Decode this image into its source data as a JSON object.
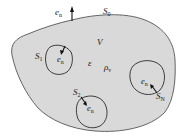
{
  "diagram": {
    "title": "",
    "colors": {
      "region_fill": "#d9d9d9",
      "outline": "#555555",
      "inner_outline": "#2a2a2a",
      "text": "#222222"
    },
    "outer_surface": {
      "label": "S",
      "label_sub": "0",
      "normal": {
        "label": "e",
        "label_sub": "n"
      }
    },
    "volume": {
      "label": "V",
      "permittivity": "ε",
      "charge_density": "ρ",
      "charge_density_sub": "v"
    },
    "inner_surfaces": [
      {
        "label": "S",
        "label_sub": "1",
        "normal_label": "e",
        "normal_sub": "n"
      },
      {
        "label": "S",
        "label_sub": "2",
        "normal_label": "e",
        "normal_sub": "n"
      },
      {
        "label": "S",
        "label_sub": "N",
        "normal_label": "e",
        "normal_sub": "n"
      }
    ]
  }
}
